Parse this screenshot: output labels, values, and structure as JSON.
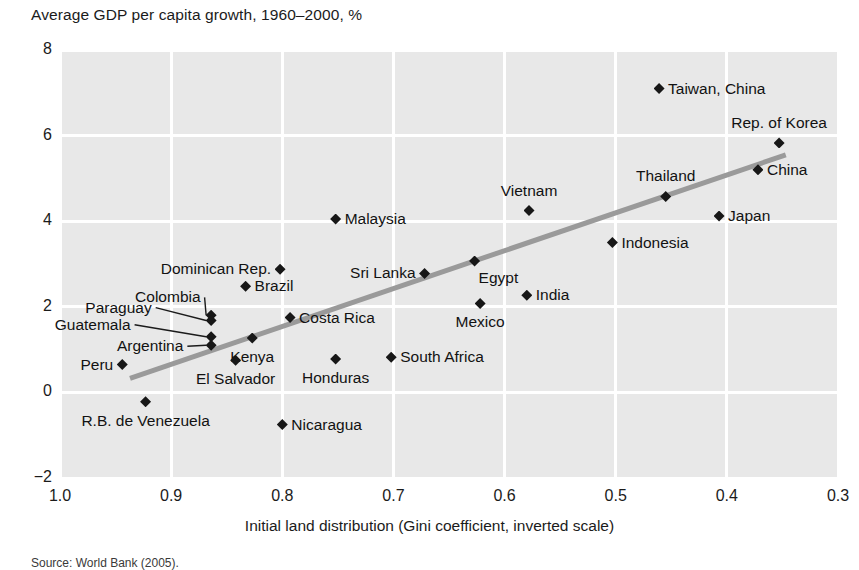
{
  "chart_data": {
    "type": "scatter",
    "title": "Average GDP per capita growth, 1960–2000, %",
    "xlabel": "Initial land distribution (Gini coefficient, inverted scale)",
    "ylabel": "Average GDP per capita growth, 1960–2000, %",
    "source": "Source: World Bank (2005).",
    "xlim": [
      1.0,
      0.3
    ],
    "ylim": [
      -2,
      8
    ],
    "inverted_x": true,
    "grid": true,
    "legend": "none",
    "xticks": [
      "1.0",
      "0.9",
      "0.8",
      "0.7",
      "0.6",
      "0.5",
      "0.4",
      "0.3"
    ],
    "xtick_values": [
      1.0,
      0.9,
      0.8,
      0.7,
      0.6,
      0.5,
      0.4,
      0.3
    ],
    "yticks": [
      "8",
      "6",
      "4",
      "2",
      "0",
      "−2"
    ],
    "ytick_values": [
      8,
      6,
      4,
      2,
      0,
      -2
    ],
    "trendline": {
      "x_start": 0.937,
      "y_start": 0.33,
      "x_end": 0.347,
      "y_end": 5.55
    },
    "points": [
      {
        "label": "Taiwan, China",
        "x": 0.461,
        "y": 7.1,
        "pos": "r"
      },
      {
        "label": "Rep. of Korea",
        "x": 0.353,
        "y": 5.83,
        "pos": "above"
      },
      {
        "label": "China",
        "x": 0.372,
        "y": 5.2,
        "pos": "r"
      },
      {
        "label": "Thailand",
        "x": 0.455,
        "y": 4.58,
        "pos": "above"
      },
      {
        "label": "Vietnam",
        "x": 0.578,
        "y": 4.25,
        "pos": "above"
      },
      {
        "label": "Japan",
        "x": 0.407,
        "y": 4.12,
        "pos": "r"
      },
      {
        "label": "Malaysia",
        "x": 0.752,
        "y": 4.05,
        "pos": "r"
      },
      {
        "label": "Indonesia",
        "x": 0.503,
        "y": 3.5,
        "pos": "r"
      },
      {
        "label": "Egypt",
        "x": 0.627,
        "y": 3.07,
        "pos": "belowright"
      },
      {
        "label": "Dominican Rep.",
        "x": 0.802,
        "y": 2.88,
        "pos": "l"
      },
      {
        "label": "Sri Lanka",
        "x": 0.672,
        "y": 2.78,
        "pos": "l"
      },
      {
        "label": "Brazil",
        "x": 0.833,
        "y": 2.48,
        "pos": "r"
      },
      {
        "label": "India",
        "x": 0.58,
        "y": 2.27,
        "pos": "r"
      },
      {
        "label": "Mexico",
        "x": 0.622,
        "y": 2.08,
        "pos": "below"
      },
      {
        "label": "Colombia",
        "x": 0.864,
        "y": 1.8,
        "pos": "leader"
      },
      {
        "label": "Paraguay",
        "x": 0.864,
        "y": 1.68,
        "pos": "leader"
      },
      {
        "label": "Costa Rica",
        "x": 0.793,
        "y": 1.75,
        "pos": "r"
      },
      {
        "label": "Guatemala",
        "x": 0.864,
        "y": 1.3,
        "pos": "leader"
      },
      {
        "label": "Kenya",
        "x": 0.827,
        "y": 1.27,
        "pos": "below"
      },
      {
        "label": "Argentina",
        "x": 0.864,
        "y": 1.1,
        "pos": "leader"
      },
      {
        "label": "El Salvador",
        "x": 0.842,
        "y": 0.75,
        "pos": "below"
      },
      {
        "label": "Honduras",
        "x": 0.752,
        "y": 0.78,
        "pos": "below"
      },
      {
        "label": "South Africa",
        "x": 0.702,
        "y": 0.82,
        "pos": "r"
      },
      {
        "label": "Peru",
        "x": 0.944,
        "y": 0.65,
        "pos": "l"
      },
      {
        "label": "R.B. de Venezuela",
        "x": 0.923,
        "y": -0.22,
        "pos": "below"
      },
      {
        "label": "Nicaragua",
        "x": 0.8,
        "y": -0.75,
        "pos": "r"
      }
    ]
  },
  "style": {
    "plot_bg": "#e8e8e8",
    "grid_color": "#ffffff",
    "marker_color": "#171717",
    "trend_color": "#9a9a9a",
    "text_color": "#1b1b1b"
  }
}
